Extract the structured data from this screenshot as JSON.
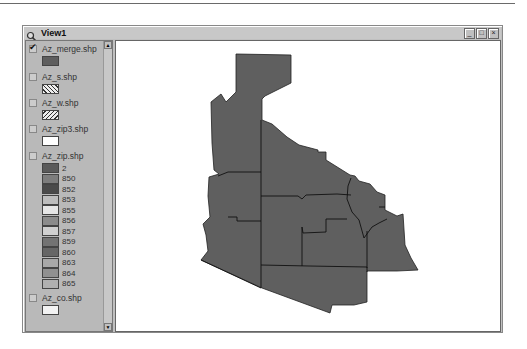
{
  "window": {
    "title": "View1",
    "controls": [
      "minimize",
      "maximize",
      "close"
    ]
  },
  "toc": {
    "layers": [
      {
        "name": "Az_merge.shp",
        "checked": true,
        "symbol": {
          "type": "fill",
          "color": "#5e5e5e"
        }
      },
      {
        "name": "Az_s.shp",
        "checked": false,
        "symbol": {
          "type": "hatch-back",
          "color": "#333333"
        }
      },
      {
        "name": "Az_w.shp",
        "checked": false,
        "symbol": {
          "type": "hatch-fwd",
          "color": "#333333"
        }
      },
      {
        "name": "Az_zip3.shp",
        "checked": false,
        "symbol": {
          "type": "fill",
          "color": "#ffffff"
        }
      },
      {
        "name": "Az_zip.shp",
        "checked": false,
        "legend": [
          {
            "label": "2",
            "color": "#5a5a5a"
          },
          {
            "label": "850",
            "color": "#7d7d7d"
          },
          {
            "label": "852",
            "color": "#4a4a4a"
          },
          {
            "label": "853",
            "color": "#bdbdbd"
          },
          {
            "label": "855",
            "color": "#e6e6e6"
          },
          {
            "label": "856",
            "color": "#8c8c8c"
          },
          {
            "label": "857",
            "color": "#d0d0d0"
          },
          {
            "label": "859",
            "color": "#737373"
          },
          {
            "label": "860",
            "color": "#666666"
          },
          {
            "label": "863",
            "color": "#a8a8a8"
          },
          {
            "label": "864",
            "color": "#909090"
          },
          {
            "label": "865",
            "color": "#b0b0b0"
          }
        ]
      },
      {
        "name": "Az_co.shp",
        "checked": false,
        "symbol": {
          "type": "fill",
          "color": "#f2f2f2"
        }
      }
    ]
  },
  "map": {
    "layer": "Az_merge.shp",
    "fill": "#5f5f5f",
    "outline": "#111111"
  }
}
